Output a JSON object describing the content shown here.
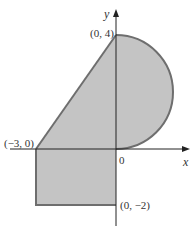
{
  "figure": {
    "colors": {
      "fill": "#c4c4c4",
      "boundary": "#6e6e6e",
      "axis": "#222222"
    },
    "axes": {
      "x_label": "x",
      "y_label": "y",
      "origin_label": "0"
    },
    "points": [
      {
        "id": "p-top",
        "label": "(0, 4)",
        "x": 0,
        "y": 4
      },
      {
        "id": "p-left",
        "label": "(−3, 0)",
        "x": -3,
        "y": 0
      },
      {
        "id": "p-bottom",
        "label": "(0, −2)",
        "x": 0,
        "y": -2
      }
    ],
    "regions": [
      {
        "name": "triangle",
        "vertices": [
          [
            -3,
            0
          ],
          [
            0,
            4
          ],
          [
            0,
            0
          ]
        ]
      },
      {
        "name": "semicircle",
        "center": [
          0,
          2
        ],
        "radius": 2,
        "side": "right"
      },
      {
        "name": "rectangle",
        "vertices": [
          [
            -3,
            0
          ],
          [
            0,
            0
          ],
          [
            0,
            -2
          ],
          [
            -3,
            -2
          ]
        ]
      }
    ]
  }
}
